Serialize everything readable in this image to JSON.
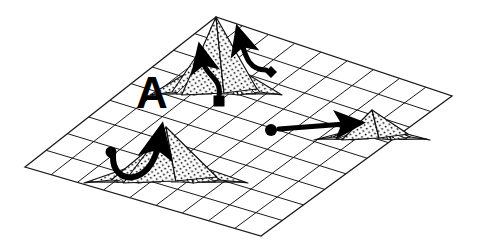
{
  "figure": {
    "background_color": "#ffffff",
    "ink_color": "#000000",
    "width": 477,
    "height": 250
  },
  "labels": [
    {
      "id": "peak-label-a",
      "text": "A",
      "x": 152,
      "y": 108,
      "font_size": 44,
      "weight": "bold",
      "color": "#000000"
    }
  ],
  "surface": {
    "name": "perspective-grid-plane",
    "corner_left": [
      25,
      167
    ],
    "corner_top": [
      216,
      17
    ],
    "corner_right": [
      452,
      96
    ],
    "corner_bottom": [
      261,
      236
    ],
    "cols": 9,
    "rows": 9,
    "stroke_color": "#1a1a1a",
    "stroke_width": 1.0,
    "fill": "#ffffff"
  },
  "peaks": [
    {
      "id": "peak-center-tall",
      "name": "tall-central-peak",
      "apex": [
        216,
        17
      ],
      "base_half_width": 66,
      "height": 78,
      "fill_pattern": "stipple-dots",
      "stipple_density": "medium"
    },
    {
      "id": "peak-lower-left-cluster",
      "name": "lower-left-peak-cluster",
      "apex": [
        166,
        127
      ],
      "base_half_width": 82,
      "height": 56,
      "fill_pattern": "stipple-dots",
      "stipple_density": "medium"
    },
    {
      "id": "peak-right-ridge",
      "name": "right-low-ridge",
      "apex": [
        372,
        110
      ],
      "base_half_width": 58,
      "height": 30,
      "fill_pattern": "stipple-dots",
      "stipple_density": "medium"
    }
  ],
  "markers": [
    {
      "id": "marker-circle-left",
      "shape": "circle",
      "x": 111,
      "y": 152,
      "size": 11,
      "fill": "#000000"
    },
    {
      "id": "marker-square-center",
      "shape": "square",
      "x": 219,
      "y": 101,
      "size": 11,
      "fill": "#000000"
    },
    {
      "id": "marker-diamond-right",
      "shape": "diamond",
      "x": 271,
      "y": 72,
      "size": 12,
      "fill": "#000000"
    },
    {
      "id": "marker-circle-right",
      "shape": "circle",
      "x": 271,
      "y": 130,
      "size": 12,
      "fill": "#000000"
    }
  ],
  "arrows": [
    {
      "id": "arrow-circle-to-left-peak",
      "kind": "curved",
      "from_marker": "marker-circle-left",
      "to_peak": "peak-lower-left-cluster",
      "start": [
        113,
        156
      ],
      "control_1": [
        112,
        186
      ],
      "control_2": [
        150,
        186
      ],
      "end": [
        158,
        146
      ],
      "stroke_width": 6,
      "color": "#000000"
    },
    {
      "id": "arrow-square-to-center-peak",
      "kind": "curved",
      "from_marker": "marker-square-center",
      "to_peak": "peak-center-tall",
      "start": [
        219,
        96
      ],
      "control_1": [
        222,
        78
      ],
      "control_2": [
        206,
        76
      ],
      "end": [
        203,
        62
      ],
      "stroke_width": 5,
      "color": "#000000"
    },
    {
      "id": "arrow-diamond-to-center-peak",
      "kind": "curved",
      "from_marker": "marker-diamond-right",
      "to_peak": "peak-center-tall",
      "start": [
        266,
        70
      ],
      "control_1": [
        250,
        70
      ],
      "control_2": [
        246,
        58
      ],
      "end": [
        242,
        44
      ],
      "stroke_width": 5,
      "color": "#000000"
    },
    {
      "id": "arrow-circle-to-right-ridge",
      "kind": "straight",
      "from_marker": "marker-circle-right",
      "to_peak": "peak-right-ridge",
      "start": [
        279,
        129
      ],
      "end": [
        345,
        124
      ],
      "stroke_width": 5,
      "color": "#000000"
    }
  ]
}
